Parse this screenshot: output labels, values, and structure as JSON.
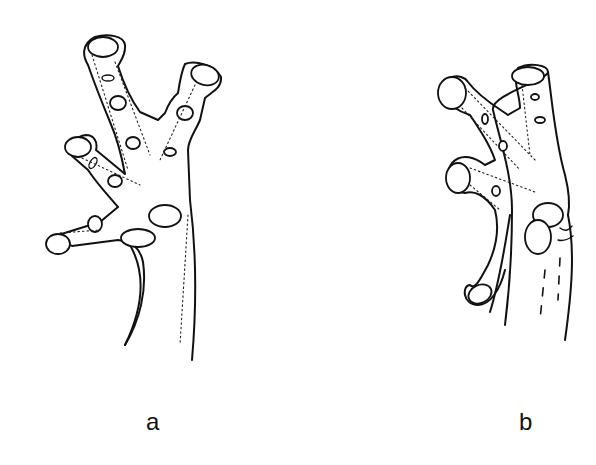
{
  "figure": {
    "background": "#ffffff",
    "line_color": "#111111",
    "panels": [
      {
        "id": "a",
        "label": "a",
        "subject": "foot illustration with four toes, expanded toe tips and subarticular tubercles"
      },
      {
        "id": "b",
        "label": "b",
        "subject": "foot illustration with four toes, webbing lines and enlarged metatarsal tubercles"
      }
    ]
  }
}
